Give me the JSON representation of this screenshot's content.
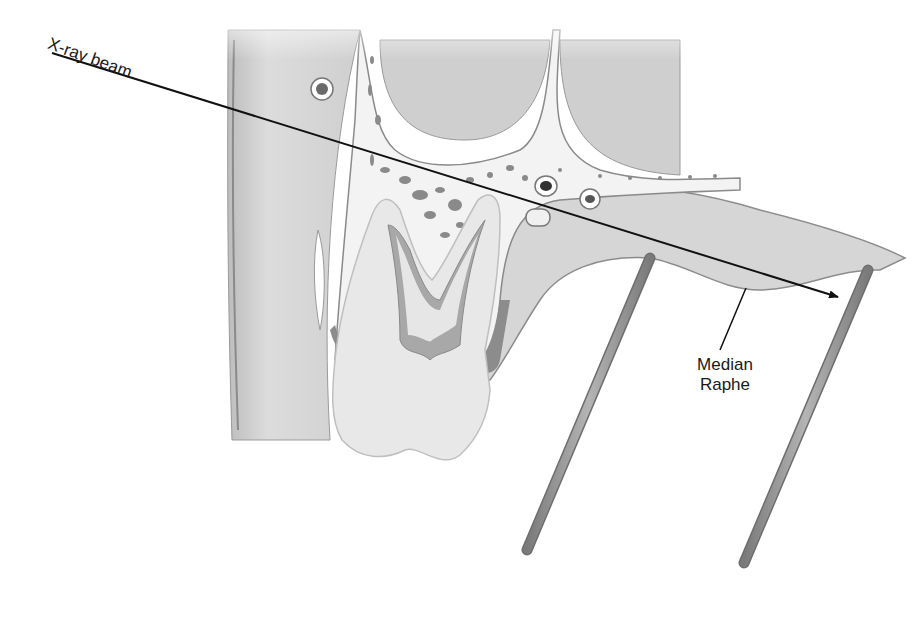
{
  "diagram": {
    "type": "anatomical-illustration",
    "labels": {
      "beam": "X-ray beam",
      "raphe_line1": "Median",
      "raphe_line2": "Raphe"
    },
    "colors": {
      "background": "#ffffff",
      "tissue": "#d8d8d8",
      "tissue_dark": "#8a8a8a",
      "bone": "#f2f2f2",
      "line": "#111111",
      "rod": "#9a9a9a"
    }
  }
}
